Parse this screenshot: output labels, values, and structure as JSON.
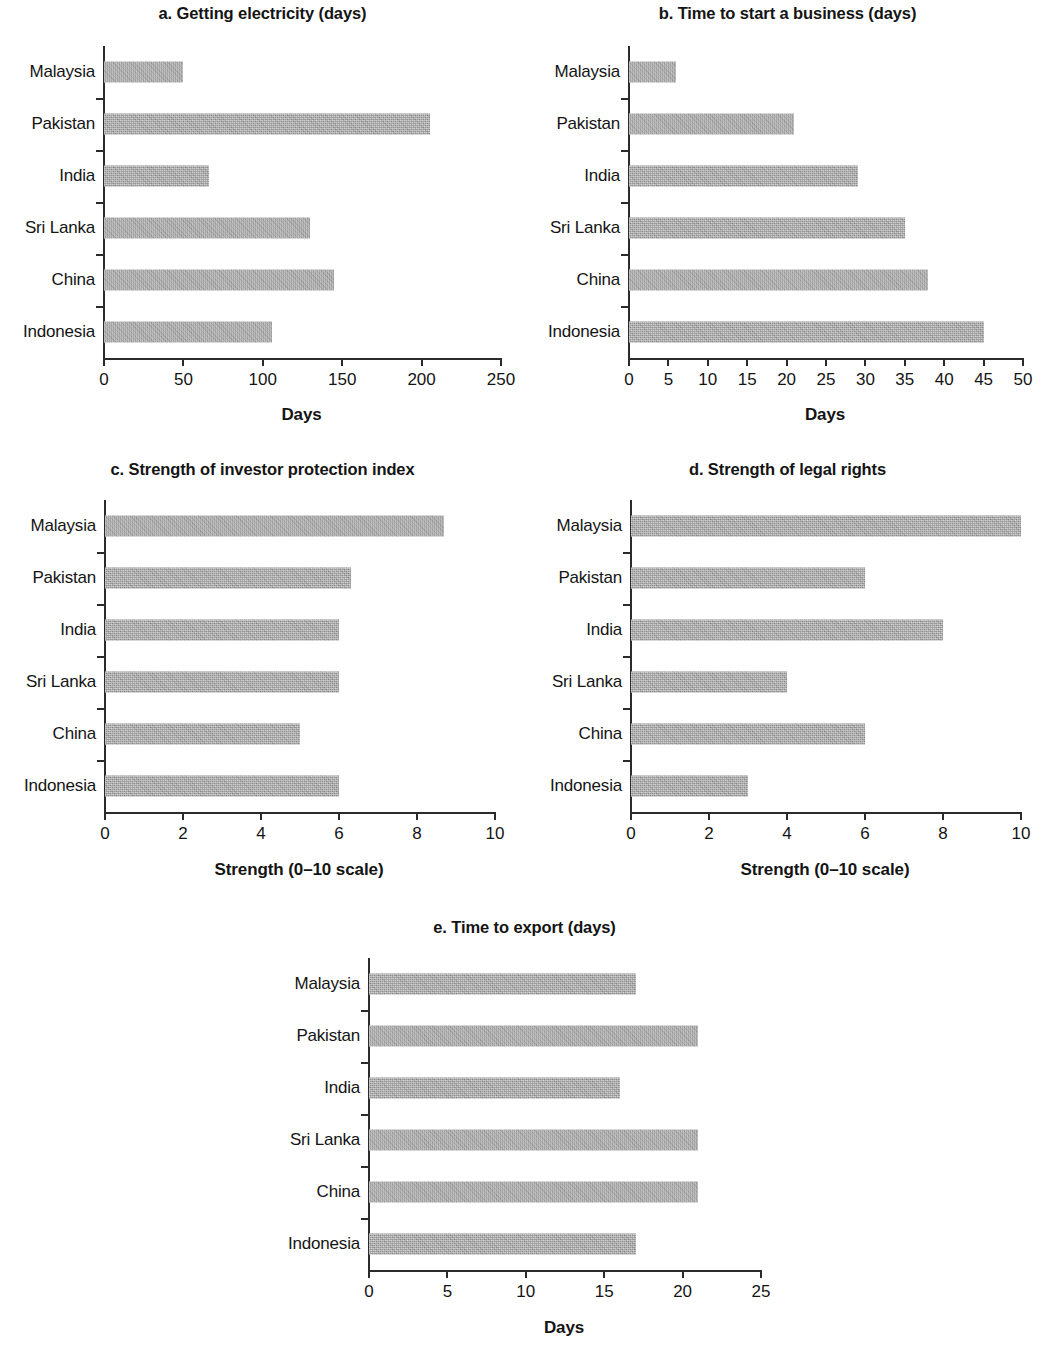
{
  "figure": {
    "categories": [
      "Malaysia",
      "Pakistan",
      "India",
      "Sri Lanka",
      "China",
      "Indonesia"
    ],
    "bar_color": "#a9a9a9",
    "axis_color": "#2b2b2b"
  },
  "chart_data": [
    {
      "type": "bar",
      "orientation": "horizontal",
      "panel": "a",
      "title": "a. Getting electricity (days)",
      "categories": [
        "Malaysia",
        "Pakistan",
        "India",
        "Sri Lanka",
        "China",
        "Indonesia"
      ],
      "values": [
        50,
        205,
        66,
        130,
        145,
        106
      ],
      "xlabel": "Days",
      "ylabel": "",
      "xlim": [
        0,
        250
      ],
      "xticks": [
        0,
        50,
        100,
        150,
        200,
        250
      ],
      "xtick_labels": [
        "0",
        "50",
        "100",
        "150",
        "200",
        "250"
      ],
      "grid": false,
      "legend": false
    },
    {
      "type": "bar",
      "orientation": "horizontal",
      "panel": "b",
      "title": "b. Time to start a business (days)",
      "categories": [
        "Malaysia",
        "Pakistan",
        "India",
        "Sri Lanka",
        "China",
        "Indonesia"
      ],
      "values": [
        6,
        21,
        29,
        35,
        38,
        45
      ],
      "xlabel": "Days",
      "ylabel": "",
      "xlim": [
        0,
        50
      ],
      "xticks": [
        0,
        5,
        10,
        15,
        20,
        25,
        30,
        35,
        40,
        45,
        50
      ],
      "xtick_labels": [
        "0",
        "5",
        "10",
        "15",
        "20",
        "25",
        "30",
        "35",
        "40",
        "45",
        "50"
      ],
      "grid": false,
      "legend": false
    },
    {
      "type": "bar",
      "orientation": "horizontal",
      "panel": "c",
      "title": "c. Strength of investor protection index",
      "categories": [
        "Malaysia",
        "Pakistan",
        "India",
        "Sri Lanka",
        "China",
        "Indonesia"
      ],
      "values": [
        8.7,
        6.3,
        6.0,
        6.0,
        5.0,
        6.0
      ],
      "xlabel": "Strength (0–10 scale)",
      "ylabel": "",
      "xlim": [
        0,
        10
      ],
      "xticks": [
        0,
        2,
        4,
        6,
        8,
        10
      ],
      "xtick_labels": [
        "0",
        "2",
        "4",
        "6",
        "8",
        "10"
      ],
      "grid": false,
      "legend": false
    },
    {
      "type": "bar",
      "orientation": "horizontal",
      "panel": "d",
      "title": "d. Strength of legal rights",
      "categories": [
        "Malaysia",
        "Pakistan",
        "India",
        "Sri Lanka",
        "China",
        "Indonesia"
      ],
      "values": [
        10,
        6,
        8,
        4,
        6,
        3
      ],
      "xlabel": "Strength (0–10 scale)",
      "ylabel": "",
      "xlim": [
        0,
        10
      ],
      "xticks": [
        0,
        2,
        4,
        6,
        8,
        10
      ],
      "xtick_labels": [
        "0",
        "2",
        "4",
        "6",
        "8",
        "10"
      ],
      "grid": false,
      "legend": false
    },
    {
      "type": "bar",
      "orientation": "horizontal",
      "panel": "e",
      "title": "e. Time to export (days)",
      "categories": [
        "Malaysia",
        "Pakistan",
        "India",
        "Sri Lanka",
        "China",
        "Indonesia"
      ],
      "values": [
        17,
        21,
        16,
        21,
        21,
        17
      ],
      "xlabel": "Days",
      "ylabel": "",
      "xlim": [
        0,
        25
      ],
      "xticks": [
        0,
        5,
        10,
        15,
        20,
        25
      ],
      "xtick_labels": [
        "0",
        "5",
        "10",
        "15",
        "20",
        "25"
      ],
      "grid": false,
      "legend": false
    }
  ]
}
